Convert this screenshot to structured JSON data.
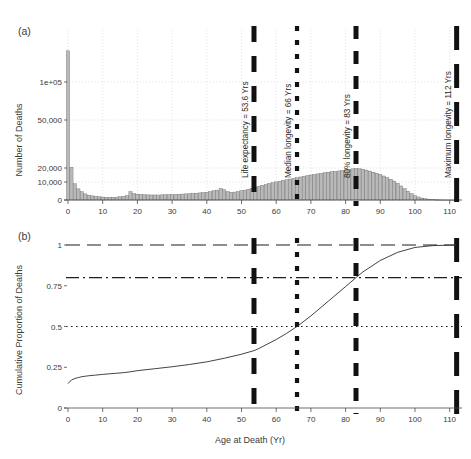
{
  "figure": {
    "panel_a": {
      "label": "(a)",
      "ylabel": "Number of Deaths",
      "ytick_labels": [
        "1e+05",
        "50,000",
        "20,000",
        "10,000",
        "0"
      ],
      "ytick_values": [
        100000,
        50000,
        20000,
        10000,
        0
      ],
      "xtick_labels": [
        "0",
        "10",
        "20",
        "30",
        "40",
        "50",
        "60",
        "70",
        "80",
        "90",
        "100",
        "110"
      ],
      "xtick_values": [
        0,
        10,
        20,
        30,
        40,
        50,
        60,
        70,
        80,
        90,
        100,
        110
      ]
    },
    "panel_b": {
      "label": "(b)",
      "ylabel": "Cumulative Proportion of Deaths",
      "xlabel": "Age at Death (Yr)",
      "ytick_labels": [
        "0",
        "0.25",
        "0.5",
        "0.75",
        "1"
      ],
      "ytick_values": [
        0,
        0.25,
        0.5,
        0.75,
        1
      ],
      "xtick_labels": [
        "0",
        "10",
        "20",
        "30",
        "40",
        "50",
        "60",
        "70",
        "80",
        "90",
        "100",
        "110"
      ],
      "xtick_values": [
        0,
        10,
        20,
        30,
        40,
        50,
        60,
        70,
        80,
        90,
        100,
        110
      ]
    },
    "annotations": [
      {
        "name": "life-expectancy",
        "text": "Life expectancy = 53.6 Yrs",
        "x": 53.6,
        "value": 53.6,
        "unit": "Yrs",
        "dash": "thick"
      },
      {
        "name": "median-longevity",
        "text": "Median longevity = 66 Yrs",
        "x": 66,
        "value": 66,
        "unit": "Yrs",
        "dash": "dotted"
      },
      {
        "name": "eighty-pct-longevity",
        "text": "80% longevity = 83 Yrs",
        "x": 83,
        "value": 83,
        "unit": "Yrs",
        "dash": "mixed"
      },
      {
        "name": "maximum-longevity",
        "text": "Maximum longevity = 112 Yrs",
        "x": 112,
        "value": 112,
        "unit": "Yrs",
        "dash": "longdash"
      }
    ],
    "reference_lines_b": [
      {
        "name": "one-line",
        "y": 1.0,
        "style": "dashed"
      },
      {
        "name": "eighty-pct-line",
        "y": 0.8,
        "style": "dash-dot"
      },
      {
        "name": "half-line",
        "y": 0.5,
        "style": "dotted"
      }
    ],
    "colors": {
      "bar_fill": "#b9b9b9",
      "bar_edge": "#5c5c5c",
      "marker": "#111111",
      "grid": "#c9c9c9",
      "text": "#3a3a3a"
    }
  },
  "chart_data": {
    "type": "bar",
    "title": "",
    "subtitle": "",
    "xlabel": "Age at Death (Yr)",
    "ylabel": "Number of Deaths",
    "xlim": [
      -2,
      116
    ],
    "ylim": [
      0,
      170000
    ],
    "y_scale": "sqrt-like (tick spacing compressed at high values)",
    "grid": true,
    "legend": "none",
    "categories": [
      0,
      1,
      2,
      3,
      4,
      5,
      6,
      7,
      8,
      9,
      10,
      11,
      12,
      13,
      14,
      15,
      16,
      17,
      18,
      19,
      20,
      21,
      22,
      23,
      24,
      25,
      26,
      27,
      28,
      29,
      30,
      31,
      32,
      33,
      34,
      35,
      36,
      37,
      38,
      39,
      40,
      41,
      42,
      43,
      44,
      45,
      46,
      47,
      48,
      49,
      50,
      51,
      52,
      53,
      54,
      55,
      56,
      57,
      58,
      59,
      60,
      61,
      62,
      63,
      64,
      65,
      66,
      67,
      68,
      69,
      70,
      71,
      72,
      73,
      74,
      75,
      76,
      77,
      78,
      79,
      80,
      81,
      82,
      83,
      84,
      85,
      86,
      87,
      88,
      89,
      90,
      91,
      92,
      93,
      94,
      95,
      96,
      97,
      98,
      99,
      100,
      101,
      102,
      103,
      104,
      105,
      106,
      107,
      108,
      109,
      110,
      111,
      112
    ],
    "values": [
      155000,
      20500,
      9000,
      6200,
      4600,
      3400,
      2700,
      2300,
      2000,
      1800,
      1650,
      1550,
      1500,
      1500,
      1600,
      1800,
      2100,
      2400,
      4600,
      3600,
      3200,
      3000,
      2900,
      2850,
      2800,
      2800,
      2800,
      2850,
      2900,
      2950,
      3000,
      3100,
      3200,
      3300,
      3400,
      3500,
      3650,
      3800,
      3950,
      4100,
      4300,
      4600,
      5100,
      5500,
      6300,
      5700,
      4700,
      4300,
      4400,
      4700,
      5100,
      5500,
      6000,
      6500,
      7000,
      7600,
      8100,
      8600,
      9100,
      9600,
      10100,
      10600,
      11100,
      11600,
      12100,
      12600,
      13100,
      13600,
      14100,
      14600,
      15000,
      15400,
      15800,
      16200,
      16600,
      17000,
      17300,
      17600,
      17900,
      18200,
      18600,
      19000,
      19400,
      19700,
      19500,
      19100,
      18500,
      17800,
      17000,
      16200,
      15300,
      14300,
      13200,
      12000,
      10700,
      9300,
      7800,
      6300,
      4900,
      3600,
      2500,
      1700,
      1100,
      700,
      430,
      260,
      150,
      85,
      45,
      22,
      11,
      5,
      2
    ],
    "series": [
      {
        "name": "Number of Deaths (histogram)",
        "type": "bar",
        "panel": "a",
        "values_note": "Deaths per single-year age bin; large infant-mortality spike at age 0 then a broad adult mortality peak near age 83."
      },
      {
        "name": "Cumulative Proportion of Deaths",
        "type": "line",
        "panel": "b",
        "x": [
          0,
          1,
          2,
          3,
          4,
          5,
          6,
          8,
          10,
          12,
          14,
          16,
          18,
          20,
          25,
          30,
          35,
          40,
          45,
          50,
          53.6,
          55,
          60,
          63,
          66,
          70,
          75,
          80,
          83,
          85,
          90,
          95,
          100,
          105,
          110,
          112
        ],
        "values": [
          0.15,
          0.172,
          0.181,
          0.187,
          0.192,
          0.195,
          0.198,
          0.202,
          0.206,
          0.21,
          0.213,
          0.217,
          0.222,
          0.229,
          0.241,
          0.253,
          0.267,
          0.283,
          0.305,
          0.33,
          0.352,
          0.365,
          0.42,
          0.458,
          0.5,
          0.565,
          0.655,
          0.745,
          0.8,
          0.835,
          0.905,
          0.955,
          0.985,
          0.996,
          0.999,
          1.0
        ]
      }
    ],
    "annotations": [
      {
        "label": "Life expectancy = 53.6 Yrs",
        "x": 53.6
      },
      {
        "label": "Median longevity = 66 Yrs",
        "x": 66
      },
      {
        "label": "80% longevity = 83 Yrs",
        "x": 83
      },
      {
        "label": "Maximum longevity = 112 Yrs",
        "x": 112
      }
    ],
    "reference_lines": [
      {
        "axis": "y",
        "value": 1.0,
        "panel": "b"
      },
      {
        "axis": "y",
        "value": 0.8,
        "panel": "b"
      },
      {
        "axis": "y",
        "value": 0.5,
        "panel": "b"
      }
    ]
  }
}
